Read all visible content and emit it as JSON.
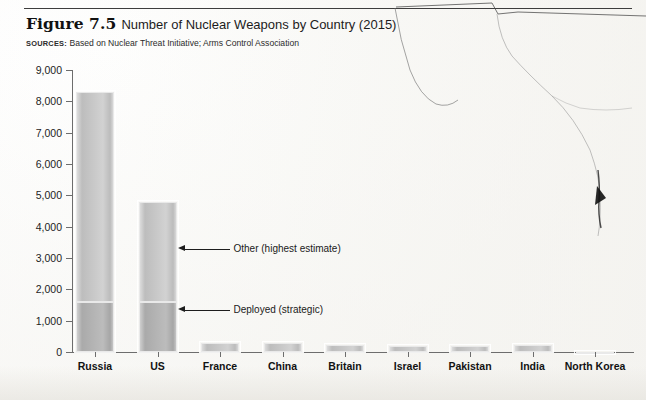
{
  "figure": {
    "number": "Figure 7.5",
    "title": "Number of Nuclear Weapons by Country (2015)",
    "sources_label": "SOURCES:",
    "sources_text": "Based on Nuclear Threat Initiative; Arms Control Association"
  },
  "chart_data": {
    "type": "bar",
    "title": "Number of Nuclear Weapons by Country (2015)",
    "xlabel": "",
    "ylabel": "",
    "ylim": [
      0,
      9000
    ],
    "ytick_labels": [
      "0",
      "1,000",
      "2,000",
      "3,000",
      "4,000",
      "5,000",
      "6,000",
      "7,000",
      "8,000",
      "9,000"
    ],
    "ytick_values": [
      0,
      1000,
      2000,
      3000,
      4000,
      5000,
      6000,
      7000,
      8000,
      9000
    ],
    "grid": false,
    "legend_position": "annotations",
    "stacked": true,
    "categories": [
      "Russia",
      "US",
      "France",
      "China",
      "Britain",
      "Israel",
      "Pakistan",
      "India",
      "North Korea"
    ],
    "series": [
      {
        "name": "Deployed (strategic)",
        "values": [
          1600,
          1600,
          0,
          0,
          0,
          0,
          0,
          0,
          0
        ]
      },
      {
        "name": "Other (highest estimate)",
        "values": [
          6700,
          3200,
          300,
          300,
          225,
          200,
          200,
          225,
          10
        ]
      }
    ],
    "totals": [
      8300,
      4800,
      300,
      300,
      225,
      200,
      200,
      225,
      10
    ],
    "annotations": [
      {
        "label": "Other (highest estimate)",
        "value": 3300
      },
      {
        "label": "Deployed (strategic)",
        "value": 1350
      }
    ]
  },
  "colors": {
    "other_segment": "#c9c9c9",
    "deployed_segment": "#b4b4b4",
    "axis": "#6d6d6d",
    "text": "#1a1a1a"
  }
}
